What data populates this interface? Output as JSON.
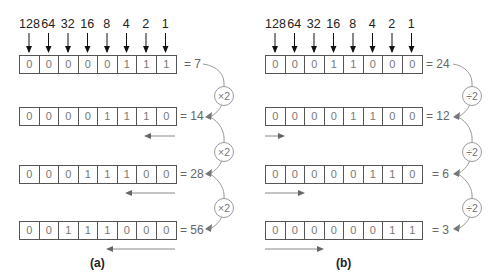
{
  "weights": [
    "128",
    "64",
    "32",
    "16",
    "8",
    "4",
    "2",
    "1"
  ],
  "panel_a": {
    "caption": "(a)",
    "operation": "×2",
    "rows": [
      {
        "bits": [
          "0",
          "0",
          "0",
          "0",
          "0",
          "1",
          "1",
          "1"
        ],
        "value": "= 7"
      },
      {
        "bits": [
          "0",
          "0",
          "0",
          "0",
          "1",
          "1",
          "1",
          "0"
        ],
        "value": "= 14"
      },
      {
        "bits": [
          "0",
          "0",
          "0",
          "1",
          "1",
          "1",
          "0",
          "0"
        ],
        "value": "= 28"
      },
      {
        "bits": [
          "0",
          "0",
          "1",
          "1",
          "1",
          "0",
          "0",
          "0"
        ],
        "value": "= 56"
      }
    ],
    "shift_direction": "left"
  },
  "panel_b": {
    "caption": "(b)",
    "operation": "÷2",
    "rows": [
      {
        "bits": [
          "0",
          "0",
          "0",
          "1",
          "1",
          "0",
          "0",
          "0"
        ],
        "value": "= 24"
      },
      {
        "bits": [
          "0",
          "0",
          "0",
          "0",
          "1",
          "1",
          "0",
          "0"
        ],
        "value": "= 12"
      },
      {
        "bits": [
          "0",
          "0",
          "0",
          "0",
          "0",
          "1",
          "1",
          "0"
        ],
        "value": "= 6"
      },
      {
        "bits": [
          "0",
          "0",
          "0",
          "0",
          "0",
          "0",
          "1",
          "1"
        ],
        "value": "= 3"
      }
    ],
    "shift_direction": "right"
  },
  "colors": {
    "border": "#555555",
    "bit_text": "#777777",
    "arrow": "#888888",
    "label": "#222222"
  }
}
